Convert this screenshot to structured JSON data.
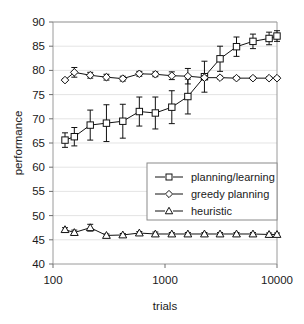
{
  "chart_data": {
    "type": "line",
    "title": "",
    "xlabel": "trials",
    "ylabel": "performance",
    "xscale": "log",
    "xlim": [
      100,
      10000
    ],
    "ylim": [
      40,
      90
    ],
    "yticks": [
      40,
      45,
      50,
      55,
      60,
      65,
      70,
      75,
      80,
      85,
      90
    ],
    "xticks": [
      100,
      1000,
      10000
    ],
    "xtick_labels": [
      "100",
      "1000",
      "10000"
    ],
    "grid": true,
    "legend_position": "center-right",
    "x": [
      128,
      155,
      215,
      300,
      420,
      590,
      820,
      1150,
      1600,
      2250,
      3100,
      4350,
      6100,
      8500,
      10000
    ],
    "series": [
      {
        "name": "planning/learning",
        "marker": "square",
        "values": [
          65.6,
          66.3,
          68.7,
          69.1,
          69.5,
          71.5,
          71.2,
          72.4,
          74.6,
          78.7,
          82.4,
          84.9,
          86.0,
          86.6,
          87.1
        ],
        "errors": [
          1.5,
          1.9,
          3.1,
          3.8,
          3.5,
          3.0,
          3.3,
          3.4,
          3.6,
          3.2,
          2.6,
          2.0,
          1.5,
          1.3,
          1.1
        ]
      },
      {
        "name": "greedy planning",
        "marker": "diamond",
        "values": [
          78.0,
          79.6,
          79.0,
          78.6,
          78.3,
          79.3,
          79.2,
          78.9,
          78.8,
          78.5,
          78.5,
          78.4,
          78.4,
          78.4,
          78.4
        ],
        "errors": [
          0.3,
          1.0,
          0.6,
          0.6,
          0.5,
          0.5,
          0.5,
          0.8,
          1.6,
          0.4,
          0.3,
          0.3,
          0.3,
          0.3,
          0.3
        ]
      },
      {
        "name": "heuristic",
        "marker": "triangle",
        "values": [
          47.1,
          46.5,
          47.5,
          45.9,
          46.0,
          46.4,
          46.2,
          46.2,
          46.2,
          46.2,
          46.2,
          46.2,
          46.2,
          46.1,
          46.1
        ],
        "errors": [
          0.4,
          0.5,
          0.7,
          0.3,
          0.3,
          0.3,
          0.4,
          0.3,
          0.3,
          0.3,
          0.3,
          0.3,
          0.3,
          0.3,
          0.3
        ]
      }
    ]
  },
  "legend": {
    "items": [
      {
        "label": "planning/learning",
        "marker": "square"
      },
      {
        "label": "greedy planning",
        "marker": "diamond"
      },
      {
        "label": "heuristic",
        "marker": "triangle"
      }
    ]
  },
  "colors": {
    "ink": "#111111",
    "frame": "#9a9a9a",
    "grid": "#d8d8d8",
    "background": "#ffffff"
  }
}
